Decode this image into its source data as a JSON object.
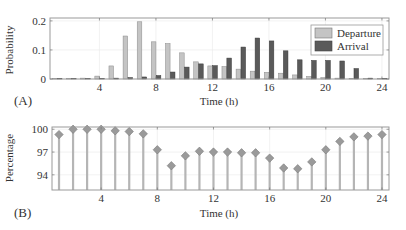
{
  "chart_data": [
    {
      "type": "bar",
      "panel_label": "(A)",
      "title": "",
      "xlabel": "Time (h)",
      "ylabel": "Probability",
      "x": [
        1,
        2,
        3,
        4,
        5,
        6,
        7,
        8,
        9,
        10,
        11,
        12,
        13,
        14,
        15,
        16,
        17,
        18,
        19,
        20,
        21,
        22,
        23,
        24
      ],
      "xlim": [
        0.5,
        24.5
      ],
      "ylim": [
        0,
        0.21
      ],
      "xticks": [
        4,
        8,
        12,
        16,
        20,
        24
      ],
      "xtick_labels": [
        "4",
        "8",
        "12",
        "16",
        "20",
        "24"
      ],
      "yticks": [
        0,
        0.1,
        0.2
      ],
      "ytick_labels": [
        "0",
        "0.1",
        "0.2"
      ],
      "grid": true,
      "legend_position": "top-right",
      "series": [
        {
          "name": "Departure",
          "color": "#c4c4c4",
          "values": [
            0.001,
            0.002,
            0.003,
            0.01,
            0.045,
            0.148,
            0.197,
            0.128,
            0.122,
            0.09,
            0.059,
            0.045,
            0.043,
            0.034,
            0.027,
            0.023,
            0.02,
            0.014,
            0.009,
            0.005,
            0.003,
            0.002,
            0.001,
            0.0
          ]
        },
        {
          "name": "Arrival",
          "color": "#5a5a5a",
          "values": [
            0.0,
            0.0,
            0.0,
            0.001,
            0.003,
            0.005,
            0.007,
            0.012,
            0.024,
            0.041,
            0.052,
            0.046,
            0.072,
            0.11,
            0.141,
            0.131,
            0.097,
            0.066,
            0.064,
            0.064,
            0.062,
            0.036,
            0.003,
            0.0
          ]
        }
      ]
    },
    {
      "type": "stem",
      "panel_label": "(B)",
      "title": "",
      "xlabel": "Time (h)",
      "ylabel": "Percentage",
      "x": [
        1,
        2,
        3,
        4,
        5,
        6,
        7,
        8,
        9,
        10,
        11,
        12,
        13,
        14,
        15,
        16,
        17,
        18,
        19,
        20,
        21,
        22,
        23,
        24
      ],
      "xlim": [
        0.5,
        24.5
      ],
      "ylim": [
        92,
        100.3
      ],
      "xticks": [
        4,
        8,
        12,
        16,
        20,
        24
      ],
      "xtick_labels": [
        "4",
        "8",
        "12",
        "16",
        "20",
        "24"
      ],
      "yticks": [
        94,
        97,
        100
      ],
      "ytick_labels": [
        "94",
        "97",
        "100"
      ],
      "grid": true,
      "marker": "diamond",
      "color": "#b5b5b5",
      "marker_color": "#9a9a9a",
      "values": [
        99.3,
        100.0,
        100.0,
        100.0,
        99.8,
        99.7,
        99.4,
        97.3,
        95.2,
        96.5,
        97.1,
        97.0,
        97.0,
        96.9,
        96.9,
        96.2,
        94.9,
        94.8,
        95.7,
        97.3,
        98.4,
        99.0,
        99.1,
        99.3
      ]
    }
  ]
}
